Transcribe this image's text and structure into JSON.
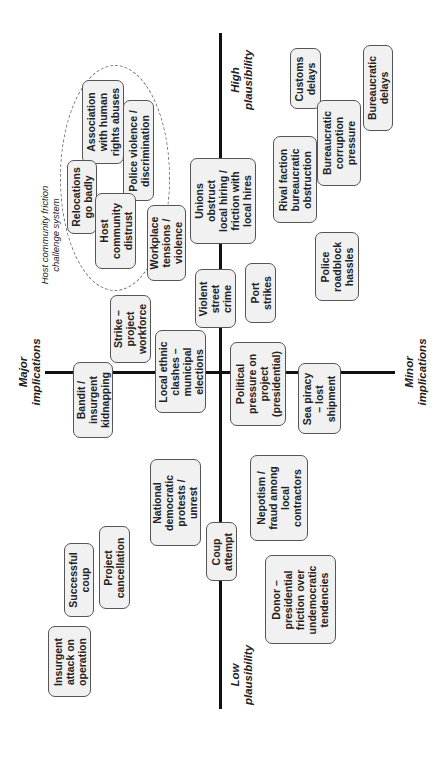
{
  "axes": {
    "high_plausibility": "High\nplausibility",
    "low_plausibility": "Low\nplausibility",
    "major_implications": "Major\nimplications",
    "minor_implications": "Minor\nimplications"
  },
  "cluster": {
    "label": "Host community friction\nchallenge system"
  },
  "risks": {
    "human_rights": "Association\nwith human\nrights abuses",
    "relocations": "Relocations\ngo badly",
    "police_violence": "Police violence /\ndiscrimination",
    "host_distrust": "Host\ncommunity\ndistrust",
    "workplace": "Workplace\ntensions /\nviolence",
    "unions": "Unions\nobstruct\nlocal hiring /\nfriction with\nlocal hires",
    "customs": "Customs\ndelays",
    "bureaucratic_delays": "Bureaucratic\ndelays",
    "rival_faction": "Rival faction\nbureaucratic\nobstruction",
    "corruption": "Bureaucratic\ncorruption\npressure",
    "roadblock": "Police\nroadblock\nhassles",
    "port_strikes": "Port\nstrikes",
    "street_crime": "Violent\nstreet\ncrime",
    "strike_workforce": "Strike –\nproject\nworkforce",
    "kidnapping": "Bandit /\ninsurgent\nkidnapping",
    "ethnic_clashes": "Local ethnic\nclashes –\nmunicipal\nelections",
    "political_pressure": "Political\npressure on\nproject\n(presidential)",
    "sea_piracy": "Sea piracy\n– lost\nshipment",
    "protests": "National\ndemocratic\nprotests /\nunrest",
    "coup_attempt": "Coup\nattempt",
    "nepotism": "Nepotism /\nfraud among\nlocal\ncontractors",
    "successful_coup": "Successful\ncoup",
    "cancellation": "Project\ncancellation",
    "insurgent_attack": "Insurgent\nattack on\noperation",
    "donor": "Donor –\npresidential\nfriction over\nundemocratic\ntendencies"
  },
  "colors": {
    "box_fill": "#f1f1f1",
    "box_border": "#555555",
    "axis": "#111111"
  }
}
